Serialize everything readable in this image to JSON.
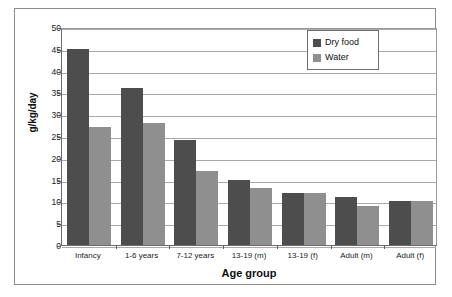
{
  "chart_data": {
    "type": "bar",
    "title": "",
    "xlabel": "Age group",
    "ylabel": "g/kg/day",
    "categories": [
      "Infancy",
      "1-6 years",
      "7-12 years",
      "13-19 (m)",
      "13-19 (f)",
      "Adult (m)",
      "Adult (f)"
    ],
    "series": [
      {
        "name": "Dry food",
        "color": "#4d4d4d",
        "values": [
          45,
          36,
          24,
          15,
          12,
          11,
          10
        ]
      },
      {
        "name": "Water",
        "color": "#8f8f8f",
        "values": [
          27,
          28,
          17,
          13,
          12,
          9,
          10
        ]
      }
    ],
    "ylim": [
      0,
      50
    ],
    "yticks": [
      0,
      5,
      10,
      15,
      20,
      25,
      30,
      35,
      40,
      45,
      50
    ],
    "grid": true,
    "legend_position": "top-right"
  },
  "legend": {
    "items": [
      {
        "label": "Dry food",
        "swatch": "dry"
      },
      {
        "label": "Water",
        "swatch": "water"
      }
    ]
  }
}
